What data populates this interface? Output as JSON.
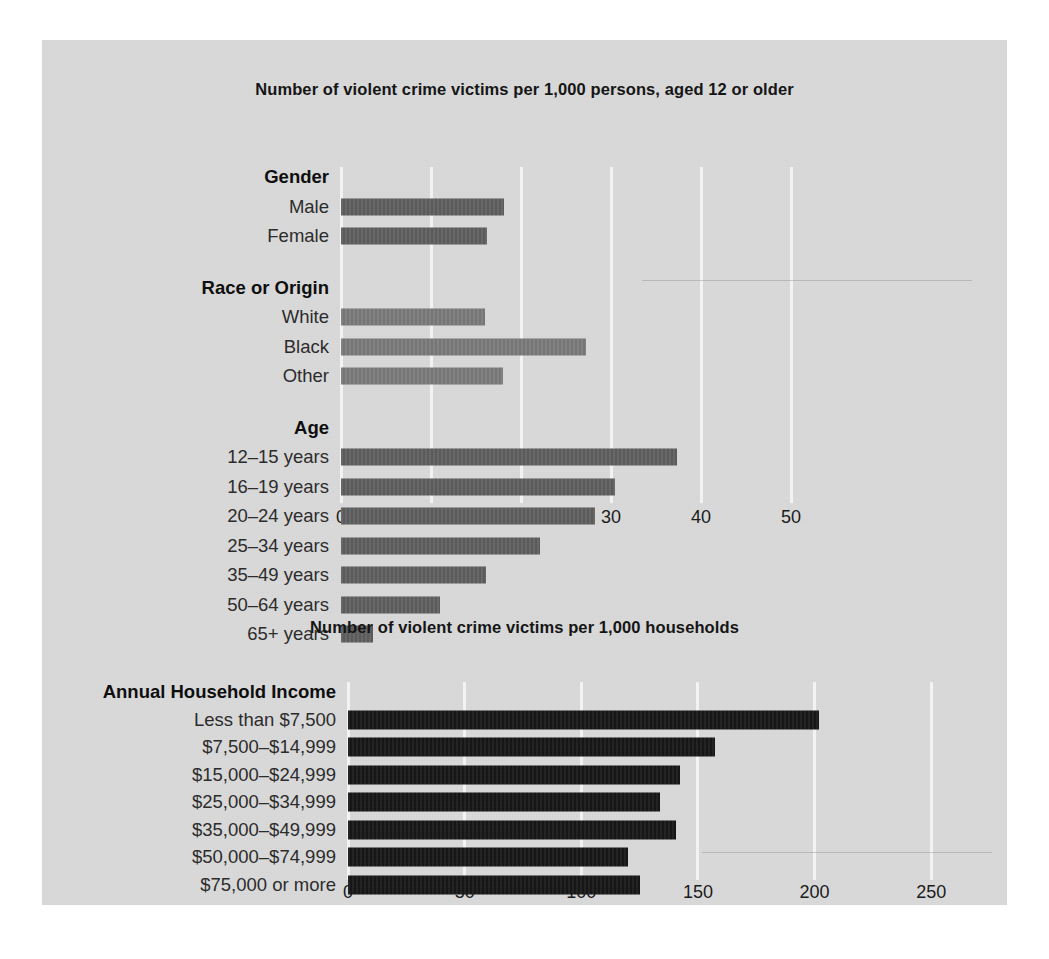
{
  "chart_data": [
    {
      "type": "bar",
      "orientation": "horizontal",
      "title": "Number of violent crime victims per 1,000 persons, aged 12 or older",
      "xlabel": "",
      "ylabel": "",
      "xlim": [
        0,
        56
      ],
      "xticks": [
        0,
        10,
        20,
        30,
        40,
        50
      ],
      "xtick_labels": [
        "0",
        "10",
        "20",
        "30",
        "40",
        "50"
      ],
      "grid": true,
      "legend": "none",
      "groups": [
        {
          "name": "Gender",
          "categories": [
            "Male",
            "Female"
          ],
          "values": [
            18.1,
            16.2
          ],
          "color": "#5f5f5f"
        },
        {
          "name": "Race or Origin",
          "categories": [
            "White",
            "Black",
            "Other"
          ],
          "values": [
            16.0,
            27.2,
            18.0
          ],
          "color": "#7b7b7b"
        },
        {
          "name": "Age",
          "categories": [
            "12–15 years",
            "16–19 years",
            "20–24 years",
            "25–34 years",
            "35–49 years",
            "50–64 years",
            "65+ years"
          ],
          "values": [
            37.3,
            30.4,
            28.2,
            22.1,
            16.1,
            11.0,
            3.5
          ],
          "color": "#5f5f5f"
        }
      ]
    },
    {
      "type": "bar",
      "orientation": "horizontal",
      "title": "Number of violent crime victims per 1,000 households",
      "xlabel": "",
      "ylabel": "",
      "xlim": [
        0,
        270
      ],
      "xticks": [
        0,
        50,
        100,
        150,
        200,
        250
      ],
      "xtick_labels": [
        "0",
        "50",
        "100",
        "150",
        "200",
        "250"
      ],
      "grid": true,
      "legend": "none",
      "groups": [
        {
          "name": "Annual Household Income",
          "categories": [
            "Less than $7,500",
            "$7,500–$14,999",
            "$15,000–$24,999",
            "$25,000–$34,999",
            "$35,000–$49,999",
            "$50,000–$74,999",
            "$75,000 or more"
          ],
          "values": [
            201.7,
            157.3,
            142.3,
            133.7,
            140.6,
            120.0,
            125.2
          ],
          "color": "#161616"
        }
      ]
    }
  ],
  "colors": {
    "panel_background": "#d9d9d9",
    "page_background": "#ffffff",
    "gridline": "#f4f4f4",
    "bar_dark": "#5f5f5f",
    "bar_mid": "#7b7b7b",
    "bar_black": "#161616",
    "text": "#1a1a1a"
  }
}
